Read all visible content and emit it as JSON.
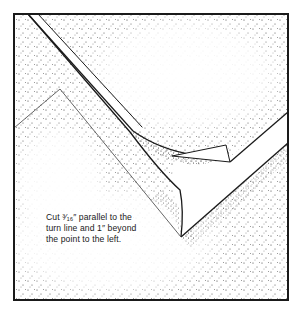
{
  "figure": {
    "caption_lines": [
      "Cut ³⁄₁₆″ parallel to the",
      "turn line and 1″ beyond",
      "the point to the left."
    ],
    "colors": {
      "ink": "#1a1a1a",
      "paper": "#ffffff",
      "stipple": "#333333"
    }
  }
}
